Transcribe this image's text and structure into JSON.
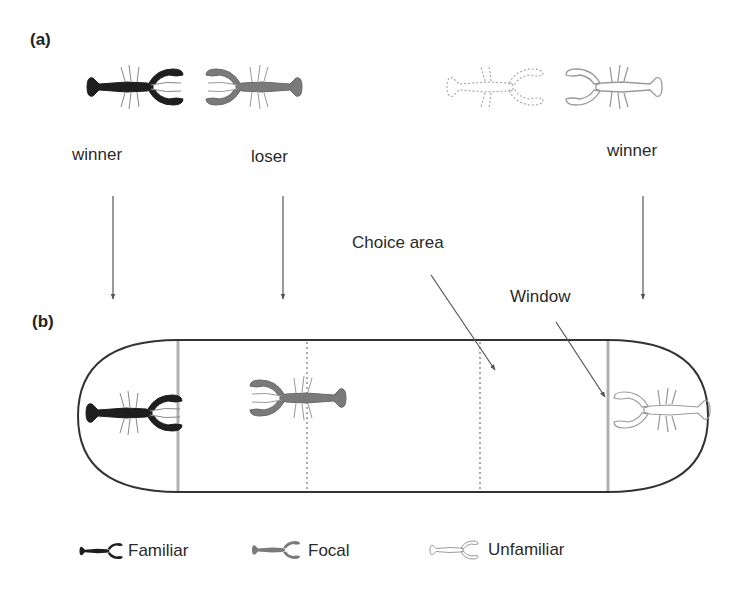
{
  "panel_a": {
    "label": "(a)",
    "crayfish": [
      {
        "role": "winner",
        "type": "familiar",
        "color": "#1e1e1e",
        "label": "winner"
      },
      {
        "role": "loser",
        "type": "focal",
        "color": "#7a7a7a",
        "label": "loser"
      },
      {
        "role": "hidden",
        "type": "dotted-outline",
        "color": "#a8a8a8",
        "label": ""
      },
      {
        "role": "winner",
        "type": "unfamiliar",
        "color": "#9a9a9a",
        "label": "winner"
      }
    ]
  },
  "panel_b": {
    "label": "(b)",
    "annotations": {
      "choice_area": "Choice area",
      "window": "Window"
    }
  },
  "legend": {
    "items": [
      {
        "label": "Familiar",
        "color": "#1e1e1e"
      },
      {
        "label": "Focal",
        "color": "#7a7a7a"
      },
      {
        "label": "Unfamiliar",
        "color": "#9a9a9a"
      }
    ]
  },
  "colors": {
    "tank_outline": "#333333",
    "window": "#b0b0b0",
    "dotted_line": "#555555",
    "arrow": "#555555"
  }
}
